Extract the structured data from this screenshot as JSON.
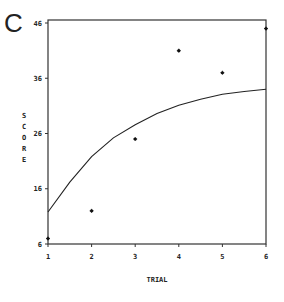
{
  "panel_label": "C",
  "chart_data": {
    "type": "scatter",
    "title": "",
    "xlabel": "TRIAL",
    "ylabel": "SCORE",
    "x_ticks": [
      "1",
      "2",
      "3",
      "4",
      "5",
      "6"
    ],
    "y_ticks": [
      "6",
      "16",
      "26",
      "36",
      "46"
    ],
    "xlim": [
      1,
      6
    ],
    "ylim": [
      6,
      46
    ],
    "grid": false,
    "legend": null,
    "series": [
      {
        "name": "observed",
        "type": "scatter",
        "marker": "asterisk",
        "x": [
          1,
          2,
          3,
          4,
          5,
          6
        ],
        "y": [
          7,
          12,
          25,
          41,
          37,
          45
        ]
      },
      {
        "name": "fitted curve",
        "type": "line",
        "x": [
          1,
          1.5,
          2,
          2.5,
          3,
          3.5,
          4,
          4.5,
          5,
          5.5,
          6
        ],
        "y": [
          11.8,
          17.2,
          21.8,
          25.2,
          27.6,
          29.6,
          31.1,
          32.2,
          33.1,
          33.6,
          34.0
        ]
      }
    ]
  }
}
